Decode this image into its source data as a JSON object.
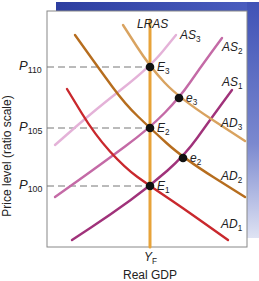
{
  "chart_data": {
    "type": "line",
    "title": "",
    "xlabel": "Real GDP",
    "ylabel": "Price level (ratio scale)",
    "y_ticks": [
      {
        "label": "P",
        "sub": "110",
        "y": 67
      },
      {
        "label": "P",
        "sub": "105",
        "y": 128
      },
      {
        "label": "P",
        "sub": "100",
        "y": 186
      }
    ],
    "x_ticks": [
      {
        "label": "Y",
        "sub": "F",
        "x": 150
      }
    ],
    "grid": false,
    "legend": "inline labels",
    "series": [
      {
        "name": "LRAS",
        "label": "LRAS",
        "sub": "",
        "color": "#e8a33a",
        "points": [
          [
            150,
            20
          ],
          [
            150,
            247
          ]
        ]
      },
      {
        "name": "AS1",
        "label": "AS",
        "sub": "1",
        "color": "#a0327a",
        "points": [
          [
            72,
            240
          ],
          [
            110,
            215
          ],
          [
            150,
            186
          ],
          [
            185,
            155
          ],
          [
            210,
            120
          ],
          [
            232,
            90
          ]
        ]
      },
      {
        "name": "AS2",
        "label": "AS",
        "sub": "2",
        "color": "#c46aa6",
        "points": [
          [
            55,
            197
          ],
          [
            100,
            165
          ],
          [
            150,
            128
          ],
          [
            180,
            97
          ],
          [
            200,
            68
          ],
          [
            222,
            38
          ]
        ]
      },
      {
        "name": "AS3",
        "label": "AS",
        "sub": "3",
        "color": "#e4b2d8",
        "points": [
          [
            55,
            145
          ],
          [
            95,
            110
          ],
          [
            150,
            67
          ],
          [
            176,
            35
          ]
        ]
      },
      {
        "name": "AD1",
        "label": "AD",
        "sub": "1",
        "color": "#c9282d",
        "points": [
          [
            67,
            89
          ],
          [
            95,
            135
          ],
          [
            125,
            168
          ],
          [
            150,
            186
          ],
          [
            180,
            206
          ],
          [
            228,
            240
          ]
        ]
      },
      {
        "name": "AD2",
        "label": "AD",
        "sub": "2",
        "color": "#b66d1e",
        "points": [
          [
            75,
            35
          ],
          [
            100,
            70
          ],
          [
            125,
            104
          ],
          [
            150,
            128
          ],
          [
            183,
            158
          ],
          [
            245,
            197
          ]
        ]
      },
      {
        "name": "AD3",
        "label": "AD",
        "sub": "3",
        "color": "#d9a360",
        "points": [
          [
            123,
            25
          ],
          [
            150,
            67
          ],
          [
            179,
            98
          ],
          [
            245,
            141
          ]
        ]
      }
    ],
    "annotations": [
      {
        "label": "E",
        "sub": "3",
        "x": 150,
        "y": 67
      },
      {
        "label": "E",
        "sub": "2",
        "x": 150,
        "y": 128
      },
      {
        "label": "E",
        "sub": "1",
        "x": 150,
        "y": 186
      },
      {
        "label": "e",
        "sub": "3",
        "x": 179,
        "y": 98
      },
      {
        "label": "e",
        "sub": "2",
        "x": 183,
        "y": 158
      }
    ],
    "frame": {
      "left": 47,
      "top": 11,
      "right": 247,
      "bottom": 247
    },
    "accent_color": "#3b4aa8"
  }
}
